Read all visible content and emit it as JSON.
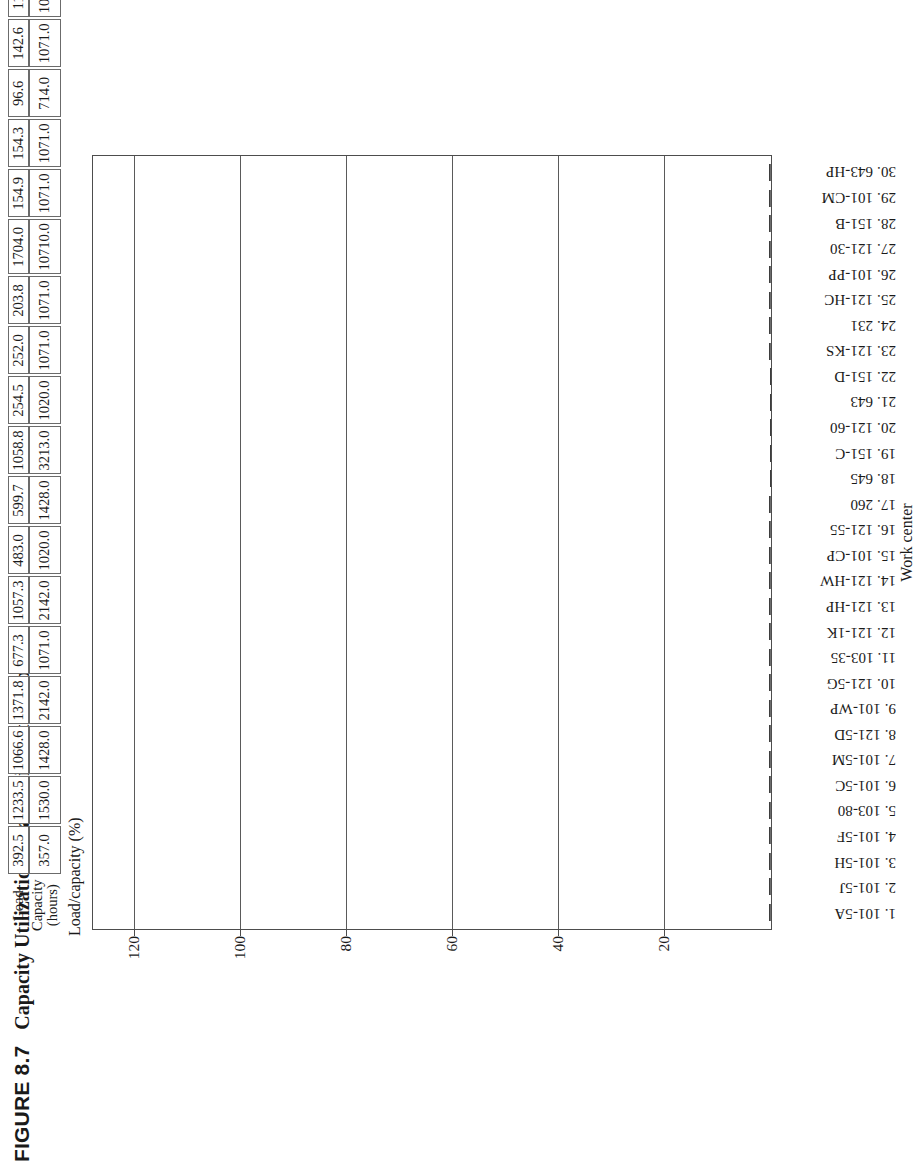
{
  "figure": {
    "number": "FIGURE 8.7",
    "title": "Capacity Utilization Chart (without Setups)"
  },
  "table": {
    "row_headers": [
      "Load",
      "Capacity (hours)"
    ],
    "capacity_header_line1": "Capacity",
    "capacity_header_line2": "(hours)",
    "load_header": "Load",
    "load": [
      "392.5",
      "1233.5",
      "1066.6",
      "1371.8",
      "677.3",
      "1057.3",
      "483.0",
      "599.7",
      "1058.8",
      "254.5",
      "252.0",
      "203.8",
      "1704.0",
      "154.9",
      "154.3",
      "96.6",
      "142.6",
      "113.3",
      "108.5",
      "34.6",
      "101.9",
      "95.5",
      "183.3",
      "76.1",
      "62.0",
      "60.2",
      "60.1",
      "240.1",
      "108.6",
      "48.0"
    ],
    "capacity": [
      "357.0",
      "1530.0",
      "1428.0",
      "2142.0",
      "1071.0",
      "2142.0",
      "1020.0",
      "1428.0",
      "3213.0",
      "1020.0",
      "1071.0",
      "1071.0",
      "10710.0",
      "1071.0",
      "1071.0",
      "714.0",
      "1071.0",
      "1071.0",
      "1071.0",
      "357.0",
      "1071.0",
      "1071.0",
      "2142.0",
      "1071.0",
      "1071.0",
      "1071.0",
      "1071.0",
      "4284.0",
      "2142.0",
      "1071.0"
    ]
  },
  "chart_data": {
    "type": "bar",
    "title": "Capacity Utilization Chart (without Setups)",
    "ylabel": "Load/capacity (%)",
    "xlabel": "Work center",
    "ylim": [
      0,
      128
    ],
    "yticks": [
      20,
      40,
      60,
      80,
      100,
      120
    ],
    "grid": true,
    "legend": "none",
    "stacked": true,
    "categories": [
      "1. 101-5A",
      "2. 101-5J",
      "3. 101-5H",
      "4. 101-5F",
      "5. 103-80",
      "6. 101-5C",
      "7. 101-5M",
      "8. 121-5D",
      "9. 101-WP",
      "10. 121-5G",
      "11. 103-35",
      "12. 121-1K",
      "13. 121-HP",
      "14. 121-HW",
      "15. 101-CP",
      "16. 121-55",
      "17. 260",
      "18. 645",
      "19. 151-C",
      "20. 121-60",
      "21. 643",
      "22. 151-D",
      "23. 121-KS",
      "24. 231",
      "25. 121-HC",
      "26. 101-PP",
      "27. 121-30",
      "28. 151-B",
      "29. 101-CM",
      "30. 643-HP"
    ],
    "series": [
      {
        "name": "Load (without setups)",
        "color": "#f1f1f1",
        "values": [
          15.4,
          15.4,
          15.4,
          15.4,
          15.4,
          15.4,
          15.4,
          5.3,
          15.4,
          5.3,
          15.4,
          11.6,
          11.2,
          11.2,
          11.4,
          11.3,
          5.3,
          0.0,
          0.0,
          0.0,
          0.0,
          0.0,
          11.6,
          5.2,
          11.6,
          15.4,
          11.3,
          5.2,
          15.4,
          15.3
        ]
      },
      {
        "name": "Setup/utilization balance",
        "color": "#7a7a7a",
        "values": [
          109.6,
          81.9,
          75.3,
          64.1,
          63.7,
          49.9,
          46.6,
          41.4,
          32.3,
          24.8,
          23.4,
          18.5,
          15.4,
          13.9,
          18.8,
          13.6,
          14.1,
          15.7,
          15.4,
          15.5,
          15.5,
          15.0,
          7.9,
          8.5,
          5.0,
          5.7,
          5.6,
          5.9,
          5.0,
          4.8
        ]
      }
    ],
    "totals_percent": [
      125.0,
      97.3,
      90.7,
      79.5,
      79.1,
      65.3,
      62.0,
      46.7,
      47.7,
      30.1,
      38.8,
      30.1,
      26.6,
      25.1,
      30.2,
      24.9,
      19.4,
      15.7,
      15.4,
      15.5,
      15.5,
      15.0,
      19.5,
      13.7,
      16.6,
      21.1,
      16.9,
      11.1,
      20.4,
      20.1
    ]
  }
}
